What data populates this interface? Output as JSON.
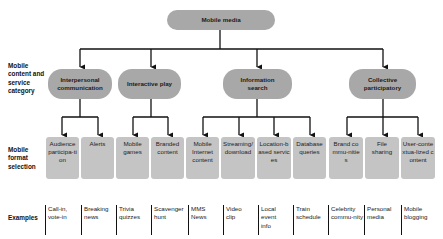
{
  "root": {
    "label": "Mobile media"
  },
  "row_labels": {
    "category": "Mobile content and service category",
    "format": "Mobile format selection",
    "examples": "Examples"
  },
  "categories": [
    {
      "label": "Interpersonal communication"
    },
    {
      "label": "Interactive play"
    },
    {
      "label": "Information search"
    },
    {
      "label": "Collective participatory"
    }
  ],
  "formats": [
    {
      "label": "Audience participa-tion",
      "category": "Interpersonal communication"
    },
    {
      "label": "Alerts",
      "category": "Interpersonal communication"
    },
    {
      "label": "Mobile games",
      "category": "Interactive play"
    },
    {
      "label": "Branded content",
      "category": "Interactive play"
    },
    {
      "label": "Mobile Internet content",
      "category": "Information search"
    },
    {
      "label": "Streaming/ download",
      "category": "Information search"
    },
    {
      "label": "Location-based services",
      "category": "Information search"
    },
    {
      "label": "Database queries",
      "category": "Information search"
    },
    {
      "label": "Brand commu-nities",
      "category": "Collective participatory"
    },
    {
      "label": "File sharing",
      "category": "Collective participatory"
    },
    {
      "label": "User-contextua-lized content",
      "category": "Collective participatory"
    }
  ],
  "examples": [
    {
      "label": "Call-in, vote-in"
    },
    {
      "label": "Breaking news"
    },
    {
      "label": "Trivia quizzes"
    },
    {
      "label": "Scavenger hunt"
    },
    {
      "label": "MMS News"
    },
    {
      "label": "Video clip"
    },
    {
      "label": "Local event info"
    },
    {
      "label": "Train schedule"
    },
    {
      "label": "Celebrity commu-nity"
    },
    {
      "label": "Personal media"
    },
    {
      "label": "Mobile blogging"
    }
  ],
  "colors": {
    "pill": "#a8a8a8",
    "format_box": "#c4c4c4",
    "line": "#111111"
  }
}
